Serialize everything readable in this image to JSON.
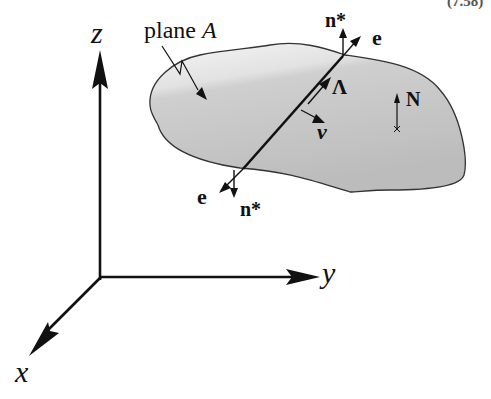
{
  "figure": {
    "corner_label": "(7.58)",
    "axes": {
      "z_label": "z",
      "y_label": "y",
      "x_label": "x"
    },
    "plane": {
      "label_text": "plane ",
      "label_symbol": "A",
      "fill_colors": {
        "light": "#f0f0f0",
        "dark": "#bdbdbd"
      }
    },
    "vectors": {
      "n_star_top": "n*",
      "e_top": "e",
      "lambda": "Λ",
      "nu": "ν",
      "N": "N",
      "e_bottom": "e",
      "n_star_bottom": "n*"
    }
  }
}
